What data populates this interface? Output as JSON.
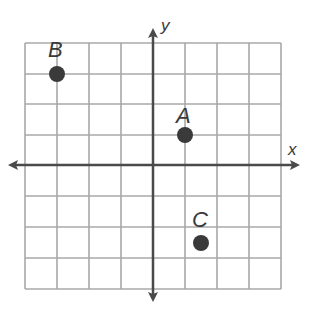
{
  "diagram": {
    "type": "coordinate-plane",
    "grid": {
      "cols": 8,
      "rows": 8,
      "x_range": [
        -4,
        4
      ],
      "y_range": [
        -4,
        4
      ],
      "line_color": "#a8a8a8"
    },
    "axes": {
      "x_label": "x",
      "y_label": "y",
      "color": "#4a4a4a"
    },
    "points": [
      {
        "label": "A",
        "x": 1,
        "y": 1
      },
      {
        "label": "B",
        "x": -3,
        "y": 3
      },
      {
        "label": "C",
        "x": 1.5,
        "y": -2.5
      }
    ],
    "point_color": "#3a3a3a"
  }
}
